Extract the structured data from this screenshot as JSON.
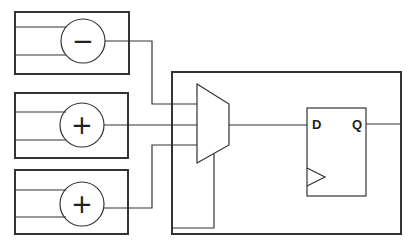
{
  "diagram": {
    "type": "circuit",
    "colors": {
      "stroke": "#333333",
      "background": "#ffffff"
    },
    "units": [
      {
        "id": "unit-1",
        "operator": "−",
        "operator_name": "subtract"
      },
      {
        "id": "unit-2",
        "operator": "+",
        "operator_name": "add"
      },
      {
        "id": "unit-3",
        "operator": "+",
        "operator_name": "add"
      }
    ],
    "mux": {
      "inputs": 3,
      "label": ""
    },
    "flipflop": {
      "d_label": "D",
      "q_label": "Q",
      "clock": "clock-triangle"
    }
  }
}
